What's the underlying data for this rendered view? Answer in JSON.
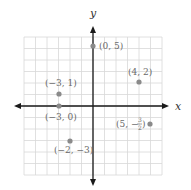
{
  "figure": {
    "x_axis_label": "x",
    "y_axis_label": "y",
    "grid": {
      "min": -6,
      "max": 6,
      "step": 1
    },
    "colors": {
      "axis": "#1a1a1a",
      "grid": "#d8d8d8",
      "point": "#8a8a8a",
      "label": "#6a6a6a"
    }
  },
  "points": [
    {
      "x": 0,
      "y": 5,
      "label": "(0, 5)"
    },
    {
      "x": 4,
      "y": 2,
      "label": "(4, 2)"
    },
    {
      "x": -3,
      "y": 1,
      "label": "(−3, 1)"
    },
    {
      "x": -3,
      "y": 0,
      "label": "(−3, 0)"
    },
    {
      "x": -2,
      "y": -3,
      "label": "(−2, −3)"
    },
    {
      "x": 5,
      "y": -1.5,
      "label_prefix": "(5, −",
      "label_frac_num": "3",
      "label_frac_den": "2",
      "label_suffix": ")"
    }
  ],
  "chart_data": {
    "type": "scatter",
    "title": "",
    "xlabel": "x",
    "ylabel": "y",
    "xlim": [
      -6,
      6
    ],
    "ylim": [
      -6,
      6
    ],
    "grid": true,
    "series": [
      {
        "name": "plotted points",
        "x": [
          0,
          4,
          -3,
          -3,
          -2,
          5
        ],
        "y": [
          5,
          2,
          1,
          0,
          -3,
          -1.5
        ],
        "labels": [
          "(0, 5)",
          "(4, 2)",
          "(−3, 1)",
          "(−3, 0)",
          "(−2, −3)",
          "(5, −3/2)"
        ]
      }
    ]
  }
}
